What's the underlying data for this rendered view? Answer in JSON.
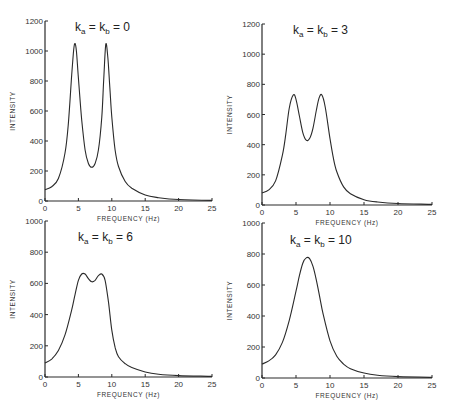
{
  "chart_data": [
    {
      "type": "line",
      "title": "k_a = k_b = 0",
      "xlabel": "FREQUENCY (Hz)",
      "ylabel": "INTENSITY",
      "xlim": [
        0,
        25
      ],
      "ylim": [
        0,
        1200
      ],
      "xticks": [
        0,
        5,
        10,
        15,
        20,
        25
      ],
      "yticks": [
        0,
        200,
        400,
        600,
        800,
        1000,
        1200
      ],
      "grid": false,
      "x": [
        0,
        1,
        2,
        3,
        3.5,
        4,
        4.3,
        4.5,
        4.7,
        5,
        5.5,
        6,
        6.5,
        7,
        7.5,
        8,
        8.5,
        8.8,
        9.1,
        9.4,
        9.7,
        10,
        10.5,
        11,
        12,
        13,
        15,
        17,
        20,
        25
      ],
      "values": [
        75,
        95,
        150,
        320,
        520,
        840,
        1010,
        1050,
        1000,
        820,
        540,
        340,
        250,
        225,
        250,
        340,
        560,
        820,
        1045,
        960,
        760,
        560,
        340,
        230,
        130,
        85,
        40,
        22,
        10,
        4
      ]
    },
    {
      "type": "line",
      "title": "k_a = k_b = 3",
      "xlabel": "FREQUENCY (Hz)",
      "ylabel": "INTENSITY",
      "xlim": [
        0,
        25
      ],
      "ylim": [
        0,
        1200
      ],
      "xticks": [
        0,
        5,
        10,
        15,
        20,
        25
      ],
      "yticks": [
        0,
        200,
        400,
        600,
        800,
        1000,
        1200
      ],
      "grid": false,
      "x": [
        0,
        1,
        2,
        3,
        3.5,
        4,
        4.6,
        5,
        5.5,
        6,
        6.5,
        7,
        7.5,
        8,
        8.4,
        8.8,
        9.3,
        10,
        10.5,
        11,
        12,
        13,
        15,
        17,
        20,
        25
      ],
      "values": [
        80,
        100,
        160,
        330,
        470,
        640,
        730,
        700,
        590,
        480,
        430,
        440,
        510,
        630,
        710,
        730,
        650,
        440,
        310,
        220,
        120,
        75,
        35,
        20,
        10,
        4
      ]
    },
    {
      "type": "line",
      "title": "k_a = k_b = 6",
      "xlabel": "FREQUENCY (Hz)",
      "ylabel": "INTENSITY",
      "xlim": [
        0,
        25
      ],
      "ylim": [
        0,
        1000
      ],
      "xticks": [
        0,
        5,
        10,
        15,
        20,
        25
      ],
      "yticks": [
        0,
        200,
        400,
        600,
        800,
        1000
      ],
      "grid": false,
      "x": [
        0,
        1,
        2,
        3,
        4,
        4.5,
        5,
        5.5,
        6,
        6.5,
        7,
        7.5,
        8,
        8.5,
        9,
        9.5,
        10,
        10.5,
        11,
        12,
        13,
        15,
        17,
        20,
        25
      ],
      "values": [
        90,
        115,
        170,
        270,
        430,
        530,
        620,
        660,
        660,
        630,
        610,
        620,
        650,
        660,
        620,
        480,
        300,
        190,
        130,
        85,
        60,
        32,
        18,
        9,
        4
      ]
    },
    {
      "type": "line",
      "title": "k_a = k_b = 10",
      "xlabel": "FREQUENCY (Hz)",
      "ylabel": "INTENSITY",
      "xlim": [
        0,
        25
      ],
      "ylim": [
        0,
        1000
      ],
      "xticks": [
        0,
        5,
        10,
        15,
        20,
        25
      ],
      "yticks": [
        0,
        200,
        400,
        600,
        800,
        1000
      ],
      "grid": false,
      "x": [
        0,
        1,
        2,
        3,
        4,
        5,
        5.5,
        6,
        6.5,
        7,
        7.5,
        8,
        8.5,
        9,
        10,
        11,
        12,
        13,
        15,
        17,
        20,
        25
      ],
      "values": [
        90,
        110,
        150,
        230,
        370,
        560,
        660,
        740,
        775,
        770,
        720,
        630,
        520,
        410,
        240,
        140,
        90,
        60,
        32,
        18,
        9,
        4
      ]
    }
  ],
  "panels": [
    {
      "title_k": "k",
      "title_sub_a": "a",
      "title_sub_b": "b",
      "title_value": "0"
    },
    {
      "title_k": "k",
      "title_sub_a": "a",
      "title_sub_b": "b",
      "title_value": "3"
    },
    {
      "title_k": "k",
      "title_sub_a": "a",
      "title_sub_b": "b",
      "title_value": "6"
    },
    {
      "title_k": "k",
      "title_sub_a": "a",
      "title_sub_b": "b",
      "title_value": "10"
    }
  ],
  "labels": {
    "xlabel": "FREQUENCY  (Hz)",
    "ylabel": "INTENSITY"
  }
}
